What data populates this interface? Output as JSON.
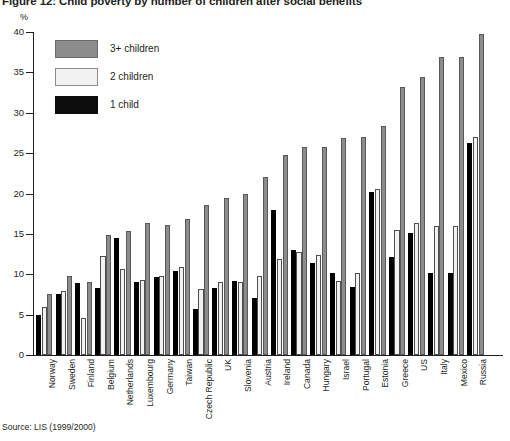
{
  "figure": {
    "title": "Figure 12: Child poverty by number of children after social benefits",
    "y_unit": "%",
    "source": "Source: LIS (1999/2000)"
  },
  "legend": {
    "position": "top-left",
    "items": [
      {
        "label": "3+ children",
        "color": "#8c8c8c",
        "key": "three_plus"
      },
      {
        "label": "2 children",
        "color": "#f2f2f2",
        "key": "two"
      },
      {
        "label": "1 child",
        "color": "#000000",
        "key": "one"
      }
    ]
  },
  "chart_data": {
    "type": "bar",
    "title": "Figure 12: Child poverty by number of children after social benefits",
    "subtitle": "",
    "xlabel": "",
    "ylabel": "%",
    "ylim": [
      0,
      40
    ],
    "yticks": [
      0,
      5,
      10,
      15,
      20,
      25,
      30,
      35,
      40
    ],
    "grid": false,
    "legend_position": "top-left",
    "annotations": [
      "Source: LIS (1999/2000)"
    ],
    "categories": [
      "Norway",
      "Sweden",
      "Finland",
      "Belgium",
      "Netherlands",
      "Luxembourg",
      "Germany",
      "Taiwan",
      "Czech Republic",
      "UK",
      "Slovenia",
      "Austria",
      "Ireland",
      "Canada",
      "Hungary",
      "Israel",
      "Portugal",
      "Estonia",
      "Greece",
      "US",
      "Italy",
      "Mexico",
      "Russia"
    ],
    "series": [
      {
        "name": "1 child",
        "color": "#000000",
        "values": [
          5.0,
          7.6,
          8.9,
          8.3,
          14.5,
          9.1,
          9.6,
          10.4,
          5.7,
          8.3,
          9.2,
          7.1,
          17.9,
          13.0,
          11.4,
          10.1,
          8.4,
          20.2,
          12.2,
          15.1,
          10.2,
          10.2,
          26.3
        ]
      },
      {
        "name": "2 children",
        "color": "#f2f2f2",
        "values": [
          6.0,
          7.9,
          4.6,
          12.3,
          10.6,
          9.3,
          9.8,
          10.9,
          8.2,
          9.1,
          9.1,
          9.8,
          11.9,
          12.8,
          12.4,
          9.2,
          10.1,
          20.5,
          15.5,
          16.3,
          16.0,
          16.0,
          27.0
        ]
      },
      {
        "name": "3+ children",
        "color": "#8c8c8c",
        "values": [
          7.6,
          9.8,
          9.1,
          14.9,
          15.4,
          16.4,
          16.1,
          16.9,
          18.6,
          19.4,
          19.9,
          22.1,
          24.8,
          25.7,
          25.8,
          26.9,
          27.0,
          28.3,
          33.2,
          34.4,
          36.9,
          36.9,
          39.8
        ]
      }
    ]
  }
}
